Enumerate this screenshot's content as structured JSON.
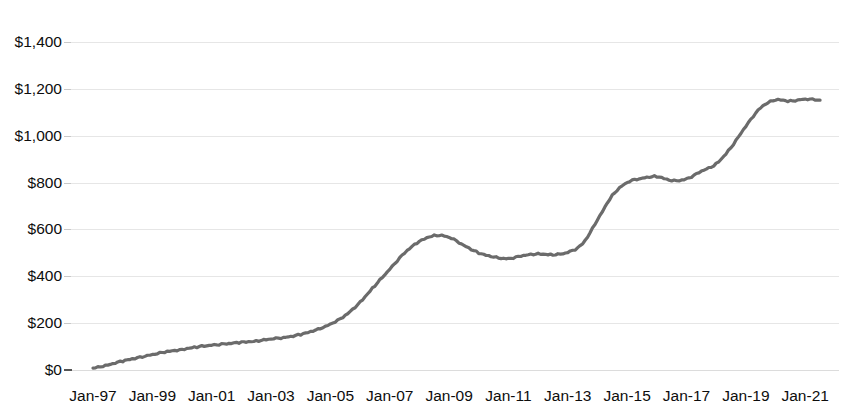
{
  "chart_data": {
    "type": "line",
    "title": "",
    "title_cropped": true,
    "subtitle": "",
    "xlabel": "",
    "ylabel": "",
    "ylim": [
      0,
      1400
    ],
    "xlim": [
      "Jan-97",
      "Jan-21"
    ],
    "grid": true,
    "legend": "none",
    "y_ticks": [
      0,
      200,
      400,
      600,
      800,
      1000,
      1200,
      1400
    ],
    "y_tick_labels": [
      "$0",
      "$200",
      "$400",
      "$600",
      "$800",
      "$1,000",
      "$1,200",
      "$1,400"
    ],
    "x_tick_labels": [
      "Jan-97",
      "Jan-99",
      "Jan-01",
      "Jan-03",
      "Jan-05",
      "Jan-07",
      "Jan-09",
      "Jan-11",
      "Jan-13",
      "Jan-15",
      "Jan-17",
      "Jan-19",
      "Jan-21"
    ],
    "line_color": "#6b6b6b",
    "line_width": 3.2,
    "series": [
      {
        "name": "Value",
        "x": [
          "Jan-97",
          "Jul-97",
          "Jan-98",
          "Jul-98",
          "Jan-99",
          "Jul-99",
          "Jan-00",
          "Jul-00",
          "Jan-01",
          "Jul-01",
          "Jan-02",
          "Jul-02",
          "Jan-03",
          "Jul-03",
          "Jan-04",
          "Jul-04",
          "Jan-05",
          "Jul-05",
          "Jan-06",
          "Jul-06",
          "Jan-07",
          "Jul-07",
          "Jan-08",
          "Jul-08",
          "Jan-09",
          "Jul-09",
          "Jan-10",
          "Jul-10",
          "Jan-11",
          "Jul-11",
          "Jan-12",
          "Jul-12",
          "Jan-13",
          "Jul-13",
          "Jan-14",
          "Jul-14",
          "Jan-15",
          "Jul-15",
          "Jan-16",
          "Jul-16",
          "Jan-17",
          "Jul-17",
          "Jan-18",
          "Jul-18",
          "Jan-19",
          "Jul-19",
          "Jan-20",
          "Jul-20",
          "Jan-21",
          "Jul-21"
        ],
        "values": [
          8,
          22,
          38,
          52,
          66,
          78,
          88,
          98,
          106,
          112,
          118,
          124,
          132,
          140,
          152,
          170,
          196,
          232,
          290,
          360,
          430,
          500,
          548,
          574,
          566,
          532,
          500,
          482,
          476,
          488,
          496,
          492,
          502,
          540,
          640,
          745,
          800,
          818,
          826,
          808,
          816,
          848,
          880,
          950,
          1040,
          1120,
          1152,
          1148,
          1156,
          1152
        ]
      }
    ],
    "annotations": []
  },
  "axes": {
    "y_labels": [
      {
        "text": "$1,400",
        "value": 1400
      },
      {
        "text": "$1,200",
        "value": 1200
      },
      {
        "text": "$1,000",
        "value": 1000
      },
      {
        "text": "$800",
        "value": 800
      },
      {
        "text": "$600",
        "value": 600
      },
      {
        "text": "$400",
        "value": 400
      },
      {
        "text": "$200",
        "value": 200
      },
      {
        "text": "$0",
        "value": 0
      }
    ],
    "x_labels": [
      {
        "text": "Jan-97"
      },
      {
        "text": "Jan-99"
      },
      {
        "text": "Jan-01"
      },
      {
        "text": "Jan-03"
      },
      {
        "text": "Jan-05"
      },
      {
        "text": "Jan-07"
      },
      {
        "text": "Jan-09"
      },
      {
        "text": "Jan-11"
      },
      {
        "text": "Jan-13"
      },
      {
        "text": "Jan-15"
      },
      {
        "text": "Jan-17"
      },
      {
        "text": "Jan-19"
      },
      {
        "text": "Jan-21"
      }
    ]
  },
  "colors": {
    "line": "#6b6b6b",
    "grid": "#e6e6e6",
    "text": "#0d0d0d",
    "background": "#ffffff"
  }
}
